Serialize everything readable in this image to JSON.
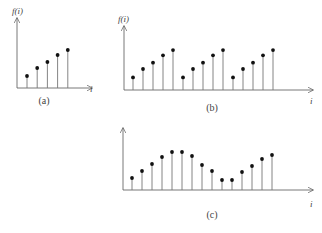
{
  "chart_data": [
    {
      "type": "stem",
      "panel_label": "(a)",
      "ylabel": "f(i)",
      "xlabel": "i",
      "x": [
        1,
        2,
        3,
        4,
        5
      ],
      "values": [
        1.2,
        2.0,
        2.6,
        3.3,
        3.8
      ]
    },
    {
      "type": "stem",
      "panel_label": "(b)",
      "ylabel": "f(i)",
      "xlabel": "i",
      "x": [
        1,
        2,
        3,
        4,
        5,
        6,
        7,
        8,
        9,
        10,
        11,
        12,
        13,
        14,
        15
      ],
      "values": [
        1.2,
        2.0,
        2.6,
        3.3,
        3.8,
        1.2,
        2.0,
        2.6,
        3.3,
        3.8,
        1.2,
        2.0,
        2.6,
        3.3,
        3.8
      ]
    },
    {
      "type": "stem",
      "panel_label": "(c)",
      "ylabel": "",
      "xlabel": "i",
      "x": [
        1,
        2,
        3,
        4,
        5,
        6,
        7,
        8,
        9,
        10,
        11,
        12,
        13,
        14,
        15
      ],
      "values": [
        1.2,
        1.9,
        2.6,
        3.3,
        3.8,
        3.8,
        3.4,
        2.5,
        1.9,
        1.0,
        1.0,
        1.8,
        2.4,
        3.1,
        3.5
      ]
    }
  ],
  "panels": {
    "a": {
      "label": "(a)",
      "ylabel": "f(i)",
      "xlabel": "i"
    },
    "b": {
      "label": "(b)",
      "ylabel": "f(i)",
      "xlabel": "i"
    },
    "c": {
      "label": "(c)",
      "xlabel": "i"
    }
  },
  "colors": {
    "axis": "#555555",
    "stem": "#777777",
    "marker": "#111111"
  }
}
